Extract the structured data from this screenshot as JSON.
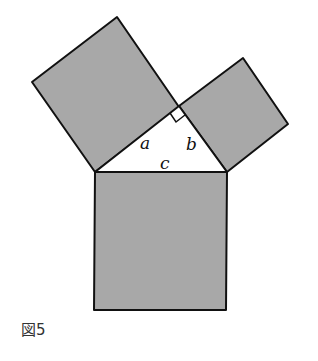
{
  "figure": {
    "caption": "図5",
    "colors": {
      "fill": "#a8a8a8",
      "stroke": "#111111",
      "background": "#ffffff"
    },
    "labels": {
      "a": "a",
      "b": "b",
      "c": "c"
    },
    "shapes": {
      "square_a": [
        [
          32,
          82
        ],
        [
          117,
          17
        ],
        [
          179,
          107
        ],
        [
          95,
          172
        ]
      ],
      "square_b": [
        [
          179,
          106
        ],
        [
          243,
          58
        ],
        [
          288,
          124
        ],
        [
          227,
          172
        ]
      ],
      "square_c": [
        [
          95,
          172
        ],
        [
          227,
          172
        ],
        [
          226,
          310
        ],
        [
          94,
          310
        ]
      ],
      "triangle": [
        [
          95,
          172
        ],
        [
          179,
          106
        ],
        [
          227,
          172
        ]
      ]
    }
  }
}
